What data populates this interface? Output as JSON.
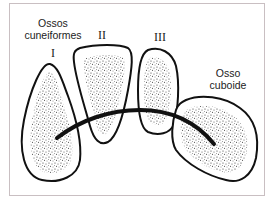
{
  "diagram": {
    "labels": {
      "cuneiform_group_line1": "Ossos",
      "cuneiform_group_line2": "cuneiformes",
      "cuboid_line1": "Osso",
      "cuboid_line2": "cuboide"
    },
    "numerals": {
      "first": "I",
      "second": "II",
      "third": "III"
    },
    "colors": {
      "outline": "#111111",
      "stipple": "#333333",
      "frame": "#c9bfc2",
      "background": "#ffffff"
    }
  }
}
